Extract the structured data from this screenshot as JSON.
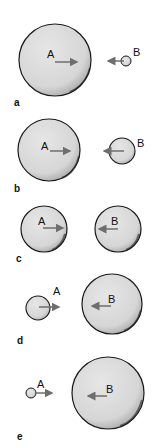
{
  "figure": {
    "colors": {
      "sphere_fill": "#d9d9d9",
      "outline": "#1a1a1a",
      "arrow": "#6e6e6e",
      "background": "#ffffff"
    },
    "panels": [
      {
        "id": "a",
        "label": "a",
        "A": {
          "label": "A",
          "cx": 55,
          "cy": 60,
          "r": 36,
          "arrow": "right"
        },
        "B": {
          "label": "B",
          "cx": 126,
          "cy": 61,
          "r": 5,
          "arrow": "left"
        }
      },
      {
        "id": "b",
        "label": "b",
        "A": {
          "label": "A",
          "cx": 49,
          "cy": 150,
          "r": 31,
          "arrow": "right"
        },
        "B": {
          "label": "B",
          "cx": 122,
          "cy": 151,
          "r": 13,
          "arrow": "left"
        }
      },
      {
        "id": "c",
        "label": "c",
        "A": {
          "label": "A",
          "cx": 44,
          "cy": 229,
          "r": 23,
          "arrow": "right"
        },
        "B": {
          "label": "B",
          "cx": 118,
          "cy": 229,
          "r": 23,
          "arrow": "left"
        }
      },
      {
        "id": "d",
        "label": "d",
        "A": {
          "label": "A",
          "cx": 38,
          "cy": 308,
          "r": 12,
          "arrow": "right"
        },
        "B": {
          "label": "B",
          "cx": 112,
          "cy": 304,
          "r": 30,
          "arrow": "left"
        }
      },
      {
        "id": "e",
        "label": "e",
        "A": {
          "label": "A",
          "cx": 31,
          "cy": 393,
          "r": 5,
          "arrow": "right"
        },
        "B": {
          "label": "B",
          "cx": 108,
          "cy": 393,
          "r": 36,
          "arrow": "left"
        }
      }
    ]
  }
}
